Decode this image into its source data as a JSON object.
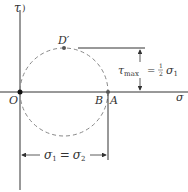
{
  "diagram": {
    "type": "Mohr's circle",
    "axes": {
      "vertical_label": "τ",
      "horizontal_label": "σ"
    },
    "points": {
      "origin": "O",
      "B": "B",
      "A": "A",
      "top": "D′"
    },
    "tau_max": {
      "label_main": "τ",
      "label_sub": "max",
      "eq": "=",
      "frac_num": "1",
      "frac_den": "2",
      "sigma": "σ",
      "sigma_sub": "1"
    },
    "sigma_dim": {
      "sigma1": "σ",
      "sub1": "1",
      "eq": "=",
      "sigma2": "σ",
      "sub2": "2"
    },
    "colors": {
      "line": "#333333",
      "circle": "#888888"
    }
  }
}
